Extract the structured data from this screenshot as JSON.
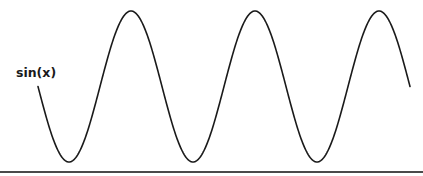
{
  "chart_data": {
    "type": "line",
    "title": "",
    "xlabel": "",
    "ylabel": "",
    "grid": false,
    "legend": "none",
    "x_range_radians": [
      3.14159,
      21.99115
    ],
    "ylim": [
      -1,
      1
    ],
    "series": [
      {
        "name": "sin(x)",
        "function": "sin",
        "label": "sin(x)",
        "label_placement": "left-of-start",
        "color": "#1a1a1a",
        "x_start": 3.14159,
        "x_end": 21.99115,
        "peaks_count": 3,
        "troughs_count": 3
      }
    ],
    "axis": {
      "x_axis_line": true,
      "y_axis_line": false,
      "axis_color": "#4a4a4a"
    }
  }
}
